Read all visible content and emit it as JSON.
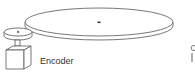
{
  "diagram": {
    "labels": {
      "encoder": "Encoder"
    },
    "components": [
      "large-disc",
      "small-pulley",
      "shaft",
      "encoder-box",
      "partial-object-right"
    ],
    "colors": {
      "stroke": "#555555",
      "fill": "#ffffff",
      "label": "#333333"
    }
  }
}
